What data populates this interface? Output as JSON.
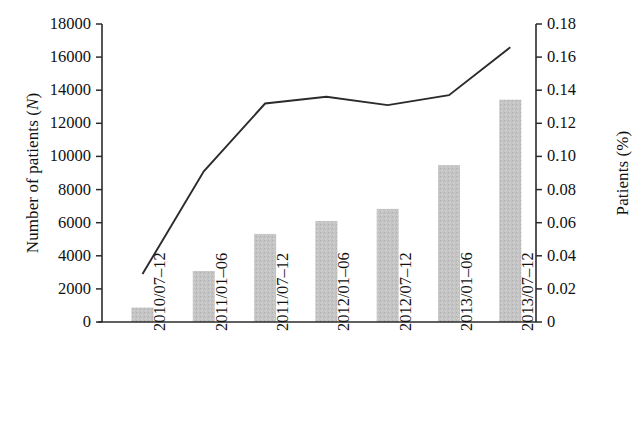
{
  "chart_data": {
    "type": "bar",
    "title": "",
    "subtitle": "",
    "categories": [
      "2010/07–12",
      "2011/01–06",
      "2011/07–12",
      "2012/01–06",
      "2012/07–12",
      "2013/01–06",
      "2013/07–12"
    ],
    "xlabel": "",
    "grid": false,
    "legend": null,
    "series": [
      {
        "name": "Number of patients (N)",
        "type": "bar",
        "axis": "left",
        "values": [
          870,
          3080,
          5320,
          6100,
          6830,
          9480,
          13430
        ],
        "color": "#c4c4c4"
      },
      {
        "name": "Patients (%)",
        "type": "line",
        "axis": "right",
        "values": [
          0.029,
          0.091,
          0.132,
          0.136,
          0.131,
          0.137,
          0.166
        ],
        "color": "#2b2b2b"
      }
    ],
    "left_axis": {
      "label": "Number of patients (N)",
      "label_prefix": "Number of patients (",
      "label_italic": "N",
      "label_suffix": ")",
      "min": 0,
      "max": 18000,
      "step": 2000,
      "ticks": [
        "0",
        "2000",
        "4000",
        "6000",
        "8000",
        "10000",
        "12000",
        "14000",
        "16000",
        "18000"
      ],
      "tick_values": [
        0,
        2000,
        4000,
        6000,
        8000,
        10000,
        12000,
        14000,
        16000,
        18000
      ]
    },
    "right_axis": {
      "label": "Patients (%)",
      "label_prefix": "Patients (%",
      "label_suffix": ")",
      "min": 0,
      "max": 0.18,
      "step": 0.02,
      "ticks": [
        "0",
        "0.02",
        "0.04",
        "0.06",
        "0.08",
        "0.10",
        "0.12",
        "0.14",
        "0.16",
        "0.18"
      ],
      "tick_values": [
        0,
        0.02,
        0.04,
        0.06,
        0.08,
        0.1,
        0.12,
        0.14,
        0.16,
        0.18
      ]
    }
  },
  "colors": {
    "bar_fill": "#c4c4c4",
    "line_stroke": "#2b2b2b",
    "axis": "#2b2b2b",
    "text": "#111111",
    "background": "#ffffff"
  }
}
